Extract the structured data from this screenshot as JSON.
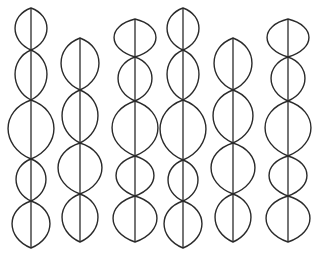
{
  "figure": {
    "stroke_color": "#2a2a2a",
    "background": "#ffffff",
    "chains": [
      {
        "x": 31,
        "nodes": [
          8,
          50,
          100,
          159,
          201,
          248
        ],
        "half_widths": [
          16,
          16,
          23,
          15,
          19
        ]
      },
      {
        "x": 80,
        "nodes": [
          38,
          90,
          143,
          194,
          242
        ],
        "half_widths": [
          19,
          18,
          22,
          18
        ]
      },
      {
        "x": 135,
        "nodes": [
          19,
          57,
          101,
          156,
          196,
          242
        ],
        "half_widths": [
          21,
          17,
          23,
          19,
          22
        ]
      },
      {
        "x": 183,
        "nodes": [
          8,
          50,
          100,
          160,
          201,
          248
        ],
        "half_widths": [
          16,
          16,
          23,
          15,
          19
        ]
      },
      {
        "x": 233,
        "nodes": [
          38,
          90,
          143,
          194,
          242
        ],
        "half_widths": [
          19,
          20,
          22,
          18
        ]
      },
      {
        "x": 288,
        "nodes": [
          19,
          57,
          101,
          156,
          196,
          242
        ],
        "half_widths": [
          21,
          17,
          23,
          19,
          22
        ]
      }
    ]
  }
}
